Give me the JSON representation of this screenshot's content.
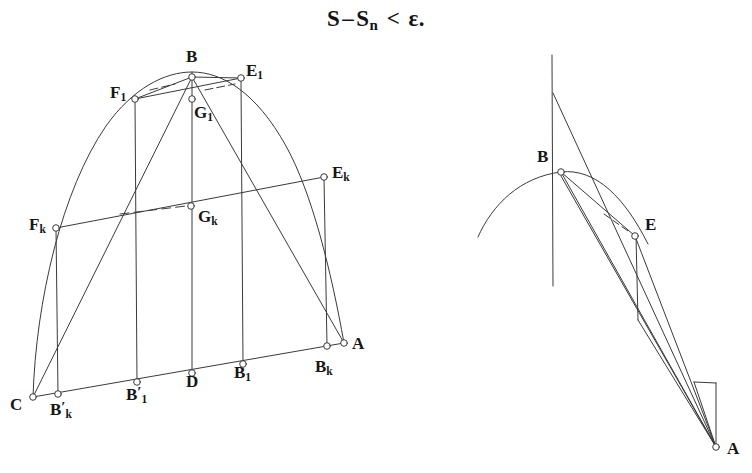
{
  "formula": {
    "full_text": "S – Sₙ < ε.",
    "lead": "S",
    "minus": "–",
    "second": "S",
    "second_sub": "n",
    "relation": "<",
    "epsilon": "ε."
  },
  "figures": {
    "left": {
      "name": "parabolic-segment-with-inscribed-polygons",
      "labels": [
        {
          "id": "B",
          "base": "B",
          "sub": "",
          "prime": false,
          "x": 186,
          "y": 48,
          "point": {
            "x": 192,
            "y": 77
          }
        },
        {
          "id": "E1",
          "base": "E",
          "sub": "1",
          "prime": false,
          "x": 246,
          "y": 62,
          "point": {
            "x": 241,
            "y": 78
          }
        },
        {
          "id": "F1",
          "base": "F",
          "sub": "1",
          "prime": false,
          "x": 110,
          "y": 84,
          "point": {
            "x": 135,
            "y": 99
          }
        },
        {
          "id": "G1",
          "base": "G",
          "sub": "1",
          "prime": false,
          "x": 194,
          "y": 104,
          "point": {
            "x": 192,
            "y": 99
          }
        },
        {
          "id": "Ek",
          "base": "E",
          "sub": "k",
          "prime": false,
          "x": 332,
          "y": 164,
          "point": {
            "x": 324,
            "y": 177
          }
        },
        {
          "id": "Gk",
          "base": "G",
          "sub": "k",
          "prime": false,
          "x": 198,
          "y": 208,
          "point": {
            "x": 191,
            "y": 206
          }
        },
        {
          "id": "Fk",
          "base": "F",
          "sub": "k",
          "prime": false,
          "x": 29,
          "y": 216,
          "point": {
            "x": 56,
            "y": 228
          }
        },
        {
          "id": "A",
          "base": "A",
          "sub": "",
          "prime": false,
          "x": 352,
          "y": 335,
          "point": {
            "x": 344,
            "y": 343
          }
        },
        {
          "id": "Bk",
          "base": "B",
          "sub": "k",
          "prime": false,
          "x": 315,
          "y": 358,
          "point": {
            "x": 327,
            "y": 346
          }
        },
        {
          "id": "B1",
          "base": "B",
          "sub": "1",
          "prime": false,
          "x": 234,
          "y": 364,
          "point": {
            "x": 243,
            "y": 364
          }
        },
        {
          "id": "D",
          "base": "D",
          "sub": "",
          "prime": false,
          "x": 186,
          "y": 373,
          "point": {
            "x": 192,
            "y": 373
          }
        },
        {
          "id": "B1p",
          "base": "B",
          "sub": "1",
          "prime": true,
          "x": 126,
          "y": 385,
          "point": {
            "x": 137,
            "y": 382
          }
        },
        {
          "id": "Bkp",
          "base": "B",
          "sub": "k",
          "prime": true,
          "x": 50,
          "y": 400,
          "point": {
            "x": 58,
            "y": 394
          }
        },
        {
          "id": "C",
          "base": "C",
          "sub": "",
          "prime": false,
          "x": 10,
          "y": 396,
          "point": {
            "x": 33,
            "y": 397
          }
        }
      ]
    },
    "right": {
      "name": "parabola-tangent-detail",
      "labels": [
        {
          "id": "B",
          "base": "B",
          "sub": "",
          "prime": false,
          "x": 537,
          "y": 148,
          "point": {
            "x": 561,
            "y": 172
          }
        },
        {
          "id": "E",
          "base": "E",
          "sub": "",
          "prime": false,
          "x": 645,
          "y": 216,
          "point": {
            "x": 635,
            "y": 236
          }
        },
        {
          "id": "A",
          "base": "A",
          "sub": "",
          "prime": false,
          "x": 727,
          "y": 440,
          "point": {
            "x": 716,
            "y": 447
          }
        }
      ]
    }
  },
  "style": {
    "stroke": "#3a3a3a",
    "marker_fill": "#ffffff",
    "background": "#ffffff"
  }
}
